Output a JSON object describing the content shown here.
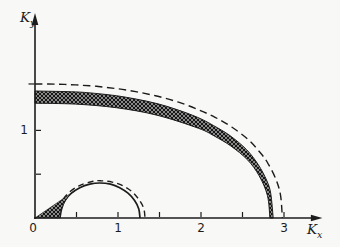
{
  "figure": {
    "background": "#f8f8f6",
    "ink": "#1c1c1c"
  },
  "chart_data": {
    "type": "line",
    "title": "",
    "xlabel": {
      "main": "K",
      "sub": "x"
    },
    "ylabel": {
      "main": "K",
      "sub": "y"
    },
    "grid": false,
    "legend": false,
    "x_axis": {
      "range": [
        0,
        3.45
      ],
      "ticks": [
        0.5,
        1,
        1.5,
        2,
        2.5,
        3
      ],
      "labeled_ticks": [
        1,
        2,
        3
      ]
    },
    "y_axis": {
      "range": [
        0,
        2.33
      ],
      "ticks": [
        0.5,
        1
      ],
      "labeled_ticks": [
        1
      ],
      "extra_tick_left": 1.53
    },
    "origin_label": "0",
    "plot": {
      "origin_px": [
        35,
        218
      ],
      "px_per_unit": [
        83,
        87.6
      ]
    },
    "series": [
      {
        "name": "upper-boundary-band",
        "style": "band-hatched",
        "outer": [
          [
            0,
            1.45
          ],
          [
            0.49,
            1.439
          ],
          [
            0.73,
            1.422
          ],
          [
            0.98,
            1.396
          ],
          [
            1.22,
            1.357
          ],
          [
            1.47,
            1.306
          ],
          [
            1.71,
            1.237
          ],
          [
            1.96,
            1.148
          ],
          [
            2.15,
            1.056
          ],
          [
            2.35,
            0.939
          ],
          [
            2.55,
            0.78
          ],
          [
            2.69,
            0.608
          ],
          [
            2.79,
            0.432
          ],
          [
            2.84,
            0.283
          ],
          [
            2.87,
            0
          ]
        ],
        "inner": [
          [
            0,
            1.31
          ],
          [
            0.49,
            1.3
          ],
          [
            0.98,
            1.259
          ],
          [
            1.47,
            1.174
          ],
          [
            1.97,
            1.024
          ],
          [
            2.16,
            0.936
          ],
          [
            2.36,
            0.822
          ],
          [
            2.56,
            0.664
          ],
          [
            2.7,
            0.483
          ],
          [
            2.8,
            0.258
          ],
          [
            2.83,
            0
          ]
        ]
      },
      {
        "name": "upper-boundary-dashed",
        "style": "dashed",
        "points": [
          [
            0,
            1.53
          ],
          [
            0.25,
            1.528
          ],
          [
            0.49,
            1.519
          ],
          [
            0.74,
            1.503
          ],
          [
            0.99,
            1.476
          ],
          [
            1.23,
            1.439
          ],
          [
            1.48,
            1.389
          ],
          [
            1.73,
            1.322
          ],
          [
            1.97,
            1.236
          ],
          [
            2.17,
            1.149
          ],
          [
            2.37,
            1.039
          ],
          [
            2.57,
            0.895
          ],
          [
            2.71,
            0.75
          ],
          [
            2.81,
            0.619
          ],
          [
            2.91,
            0.425
          ],
          [
            2.96,
            0.248
          ],
          [
            2.98,
            0
          ]
        ]
      },
      {
        "name": "lower-loop-solid",
        "style": "solid",
        "points": [
          [
            0.3,
            0
          ],
          [
            0.32,
            0.104
          ],
          [
            0.36,
            0.2
          ],
          [
            0.44,
            0.283
          ],
          [
            0.54,
            0.346
          ],
          [
            0.66,
            0.386
          ],
          [
            0.78,
            0.4
          ],
          [
            0.91,
            0.386
          ],
          [
            1.02,
            0.346
          ],
          [
            1.12,
            0.283
          ],
          [
            1.2,
            0.2
          ],
          [
            1.25,
            0.104
          ],
          [
            1.265,
            0
          ]
        ]
      },
      {
        "name": "lower-loop-dashed",
        "style": "dashed",
        "points": [
          [
            0.265,
            0
          ],
          [
            0.3,
            0.145
          ],
          [
            0.39,
            0.273
          ],
          [
            0.53,
            0.368
          ],
          [
            0.7,
            0.419
          ],
          [
            0.795,
            0.425
          ],
          [
            0.93,
            0.41
          ],
          [
            1.06,
            0.368
          ],
          [
            1.17,
            0.3
          ],
          [
            1.25,
            0.213
          ],
          [
            1.31,
            0.11
          ],
          [
            1.325,
            0
          ]
        ]
      },
      {
        "name": "origin-wedge-hatched",
        "style": "region-hatched",
        "points": [
          [
            0,
            0
          ],
          [
            0.485,
            0.315
          ],
          [
            0.41,
            0.257
          ],
          [
            0.35,
            0.169
          ],
          [
            0.31,
            0.083
          ],
          [
            0.3,
            0
          ]
        ]
      }
    ]
  }
}
